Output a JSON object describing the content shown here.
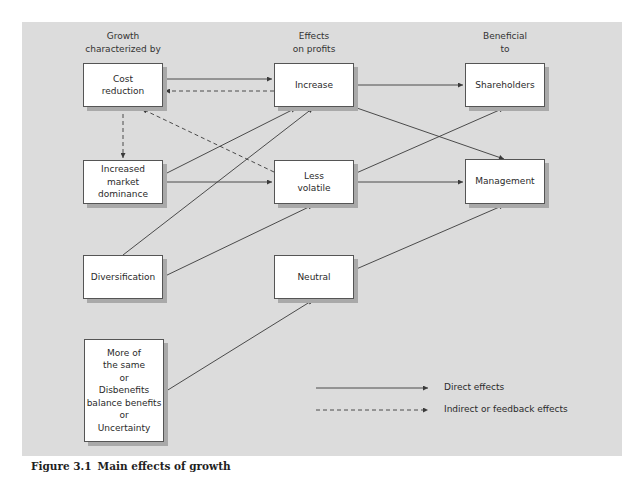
{
  "figure": {
    "caption_number": "Figure 3.1",
    "caption_title": "Main effects of growth"
  },
  "columns": {
    "growth": "Growth\ncharacterized by",
    "effects": "Effects\non profits",
    "beneficial": "Beneficial\nto"
  },
  "nodes": {
    "cost_reduction": "Cost\nreduction",
    "market_dominance": "Increased\nmarket\ndominance",
    "diversification": "Diversification",
    "more_of_same": "More of\nthe same\nor\nDisbenefits\nbalance benefits\nor\nUncertainty",
    "increase": "Increase",
    "less_volatile": "Less\nvolatile",
    "neutral": "Neutral",
    "shareholders": "Shareholders",
    "management": "Management"
  },
  "edges": [
    {
      "from": "Cost reduction",
      "to": "Increase",
      "type": "direct"
    },
    {
      "from": "Increase",
      "to": "Cost reduction",
      "type": "indirect"
    },
    {
      "from": "Cost reduction",
      "to": "Increased market dominance",
      "type": "indirect"
    },
    {
      "from": "Less volatile",
      "to": "Cost reduction",
      "type": "indirect"
    },
    {
      "from": "Increased market dominance",
      "to": "Increase",
      "type": "direct"
    },
    {
      "from": "Increased market dominance",
      "to": "Less volatile",
      "type": "direct"
    },
    {
      "from": "Diversification",
      "to": "Increase",
      "type": "direct"
    },
    {
      "from": "Diversification",
      "to": "Less volatile",
      "type": "direct"
    },
    {
      "from": "More of the same / Disbenefits balance benefits / Uncertainty",
      "to": "Neutral",
      "type": "direct"
    },
    {
      "from": "Increase",
      "to": "Shareholders",
      "type": "direct"
    },
    {
      "from": "Increase",
      "to": "Management",
      "type": "direct"
    },
    {
      "from": "Less volatile",
      "to": "Shareholders",
      "type": "direct"
    },
    {
      "from": "Less volatile",
      "to": "Management",
      "type": "direct"
    },
    {
      "from": "Neutral",
      "to": "Management",
      "type": "direct"
    }
  ],
  "legend": {
    "direct": "Direct effects",
    "indirect": "Indirect or feedback effects"
  },
  "colors": {
    "panel": "#dcdcdc",
    "box": "#ffffff",
    "line": "#3a3a3a",
    "shadow": "#a9a9a9"
  }
}
